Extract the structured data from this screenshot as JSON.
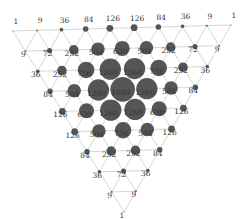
{
  "diagram": {
    "type": "trinomial-triangle",
    "n": 9,
    "corners": {
      "top_left": [
        13,
        31
      ],
      "top_right": [
        231,
        25
      ],
      "bottom": [
        124,
        212
      ]
    },
    "colors": {
      "node": "#555555",
      "edge": "#bbbbbb",
      "label": "#333333"
    },
    "rows": [
      [
        1,
        9,
        36,
        84,
        126,
        126,
        84,
        36,
        9,
        1
      ],
      [
        9,
        72,
        252,
        504,
        630,
        504,
        252,
        72,
        9
      ],
      [
        36,
        252,
        756,
        1260,
        1260,
        756,
        252,
        36
      ],
      [
        84,
        504,
        1260,
        1680,
        1260,
        504,
        84
      ],
      [
        126,
        630,
        1260,
        1260,
        630,
        126
      ],
      [
        126,
        504,
        756,
        504,
        126
      ],
      [
        84,
        252,
        252,
        84
      ],
      [
        36,
        72,
        36
      ],
      [
        9,
        9
      ],
      [
        1
      ]
    ]
  }
}
